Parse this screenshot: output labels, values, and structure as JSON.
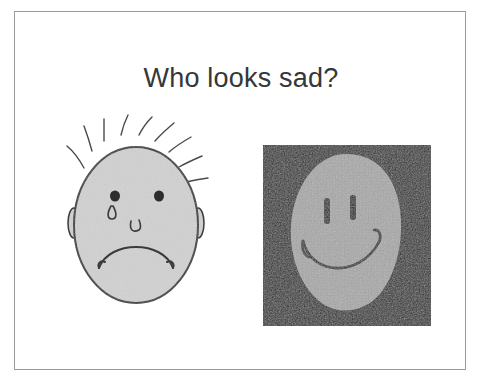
{
  "slide": {
    "title": "Who looks sad?",
    "background_color": "#ffffff",
    "frame_border_color": "#9a9a9a",
    "title_color": "#35373a"
  },
  "choices": [
    {
      "id": "sad-face-drawing",
      "name": "sad-face-drawing",
      "expression": "sad",
      "style": "hand-drawn line art",
      "alt_text": "Hand-drawn round face with spiky hair, two ears, dot eyes, a teardrop under the left eye, a small nose and a downturned frowning mouth",
      "face_fill_color": "#d2d2d2",
      "outline_color": "#3b3b3b",
      "background_color": "#ffffff",
      "features": {
        "hair_strands": 9,
        "ears": 2,
        "eyes": 2,
        "tear": 1,
        "nose": 1,
        "mouth": "frown"
      }
    },
    {
      "id": "happy-face-photo",
      "name": "happy-face-photo",
      "expression": "happy",
      "style": "grainy photograph on dark background",
      "alt_text": "Photo of a light gray oval face on a near-black square background with two vertical bar eyes and a wide smiling mouth",
      "face_fill_color": "#a8a8a8",
      "outline_color": "#1c1c1c",
      "background_color": "#2a2a2a",
      "features": {
        "eyes": 2,
        "mouth": "smile"
      }
    }
  ]
}
